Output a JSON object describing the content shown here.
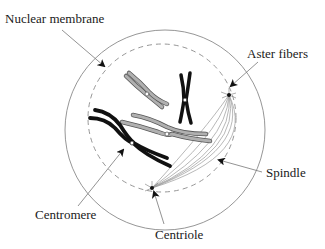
{
  "diagram": {
    "type": "cell-division-illustration",
    "labels": {
      "nuclear_membrane": "Nuclear membrane",
      "aster_fibers": "Aster fibers",
      "spindle": "Spindle",
      "centromere": "Centromere",
      "centriole": "Centriole"
    },
    "colors": {
      "outline": "#8a8a8a",
      "dark_chromosome": "#111111",
      "light_chromosome": "#a8a8a8",
      "centromere_fill": "#ffffff",
      "text": "#1a1a1a"
    }
  }
}
